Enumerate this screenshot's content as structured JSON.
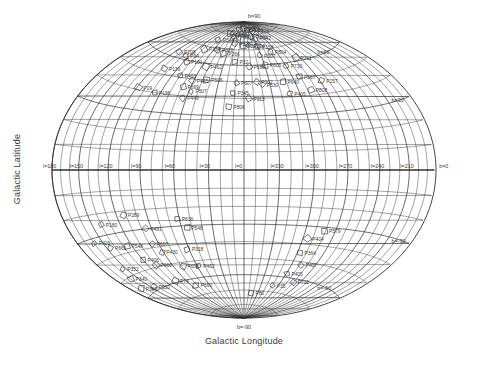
{
  "figure": {
    "type": "all-sky-aitoff-map",
    "xlabel": "Galactic Longitude",
    "ylabel": "Galactic Latitude",
    "background": "#ffffff",
    "line_color": "#2b2b2b",
    "text_color": "#3a3a3a"
  },
  "chart_data": {
    "type": "scatter",
    "title": "",
    "xlabel": "Galactic Longitude",
    "ylabel": "Galactic Latitude",
    "projection": "aitoff",
    "grid": true,
    "legend": false,
    "xlim": [
      360,
      0
    ],
    "ylim": [
      -90,
      90
    ],
    "x_tick_step_deg": 10,
    "y_tick_step_deg": 10,
    "x_label_step_deg": 30,
    "y_label_step_deg": 30,
    "xticklabels": [
      "l=180",
      "l=150",
      "l=120",
      "l=90",
      "l=60",
      "l=30",
      "l=0",
      "l=330",
      "l=300",
      "l=270",
      "l=240",
      "l=210"
    ],
    "xtickvalues": [
      180,
      150,
      120,
      90,
      60,
      30,
      0,
      330,
      300,
      270,
      240,
      210
    ],
    "yticklabels": [
      "b=90",
      "b=60",
      "b=30",
      "b=0",
      "b=-30",
      "b=-60",
      "b=-90"
    ],
    "ytickvalues": [
      90,
      60,
      30,
      0,
      -30,
      -60,
      -90
    ],
    "marker": "open-polygon",
    "point_count": 92,
    "points": [
      {
        "label": "P322",
        "l": 14,
        "b": 88
      },
      {
        "label": "P254",
        "l": 28,
        "b": 84
      },
      {
        "label": "P270",
        "l": 2,
        "b": 85
      },
      {
        "label": "P256",
        "l": 340,
        "b": 84
      },
      {
        "label": "P376",
        "l": 312,
        "b": 83
      },
      {
        "label": "P212",
        "l": 53,
        "b": 80
      },
      {
        "label": "P336",
        "l": 37,
        "b": 79
      },
      {
        "label": "P467",
        "l": 44,
        "b": 81
      },
      {
        "label": "P412",
        "l": 17,
        "b": 78
      },
      {
        "label": "P360",
        "l": 336,
        "b": 79
      },
      {
        "label": "P342",
        "l": 325,
        "b": 78
      },
      {
        "label": "P344",
        "l": 70,
        "b": 75
      },
      {
        "label": "P120",
        "l": 23,
        "b": 74
      },
      {
        "label": "P201",
        "l": 3,
        "b": 73
      },
      {
        "label": "P304",
        "l": 349,
        "b": 73
      },
      {
        "label": "P158",
        "l": 330,
        "b": 72
      },
      {
        "label": "P134",
        "l": 78,
        "b": 68
      },
      {
        "label": "P328",
        "l": 53,
        "b": 69
      },
      {
        "label": "P266",
        "l": 37,
        "b": 67
      },
      {
        "label": "P307",
        "l": 333,
        "b": 66
      },
      {
        "label": "P804",
        "l": 310,
        "b": 68
      },
      {
        "label": "P209",
        "l": 112,
        "b": 63
      },
      {
        "label": "P94",
        "l": 96,
        "b": 62
      },
      {
        "label": "P101",
        "l": 86,
        "b": 59
      },
      {
        "label": "P462",
        "l": 54,
        "b": 58
      },
      {
        "label": "P32",
        "l": 14,
        "b": 62
      },
      {
        "label": "P688",
        "l": 353,
        "b": 59
      },
      {
        "label": "P806",
        "l": 329,
        "b": 60
      },
      {
        "label": "P730",
        "l": 300,
        "b": 58
      },
      {
        "label": "P139",
        "l": 107,
        "b": 53
      },
      {
        "label": "P403",
        "l": 80,
        "b": 51
      },
      {
        "label": "P445",
        "l": 62,
        "b": 49
      },
      {
        "label": "P506",
        "l": 45,
        "b": 50
      },
      {
        "label": "P607",
        "l": 9,
        "b": 49
      },
      {
        "label": "P902",
        "l": 345,
        "b": 50
      },
      {
        "label": "P567",
        "l": 291,
        "b": 51
      },
      {
        "label": "P530",
        "l": 339,
        "b": 48
      },
      {
        "label": "P640",
        "l": 314,
        "b": 49
      },
      {
        "label": "P211",
        "l": 276,
        "b": 62
      },
      {
        "label": "P257",
        "l": 268,
        "b": 47
      },
      {
        "label": "P669",
        "l": 69,
        "b": 45
      },
      {
        "label": "P507",
        "l": 58,
        "b": 43
      },
      {
        "label": "P345",
        "l": 12,
        "b": 43
      },
      {
        "label": "P913",
        "l": 355,
        "b": 40
      },
      {
        "label": "P405",
        "l": 311,
        "b": 42
      },
      {
        "label": "P808",
        "l": 286,
        "b": 43
      },
      {
        "label": "P19",
        "l": 118,
        "b": 41
      },
      {
        "label": "P136",
        "l": 97,
        "b": 40
      },
      {
        "label": "P449",
        "l": 64,
        "b": 39
      },
      {
        "label": "P806b",
        "l": 15,
        "b": 35
      },
      {
        "label": "P180",
        "l": 140,
        "b": -25
      },
      {
        "label": "P289",
        "l": 113,
        "b": -22
      },
      {
        "label": "P636",
        "l": 62,
        "b": -26
      },
      {
        "label": "P491",
        "l": 96,
        "b": -30
      },
      {
        "label": "P548",
        "l": 55,
        "b": -31
      },
      {
        "label": "P415",
        "l": 160,
        "b": -32
      },
      {
        "label": "P661",
        "l": 146,
        "b": -36
      },
      {
        "label": "P548b",
        "l": 126,
        "b": -37
      },
      {
        "label": "P607b",
        "l": 97,
        "b": -38
      },
      {
        "label": "P579",
        "l": 281,
        "b": -32
      },
      {
        "label": "P404",
        "l": 295,
        "b": -37
      },
      {
        "label": "P430",
        "l": 92,
        "b": -43
      },
      {
        "label": "P318",
        "l": 62,
        "b": -43
      },
      {
        "label": "P352",
        "l": 155,
        "b": -46
      },
      {
        "label": "P406",
        "l": 120,
        "b": -45
      },
      {
        "label": "P660",
        "l": 110,
        "b": -49
      },
      {
        "label": "P364",
        "l": 297,
        "b": -45
      },
      {
        "label": "P340",
        "l": 160,
        "b": -51
      },
      {
        "label": "P656",
        "l": 78,
        "b": -52
      },
      {
        "label": "P462b",
        "l": 58,
        "b": -53
      },
      {
        "label": "P407",
        "l": 288,
        "b": -52
      },
      {
        "label": "P369",
        "l": 165,
        "b": -56
      },
      {
        "label": "P550",
        "l": 145,
        "b": -58
      },
      {
        "label": "P74",
        "l": 105,
        "b": -59
      },
      {
        "label": "P405b",
        "l": 299,
        "b": -58
      },
      {
        "label": "P711",
        "l": 281,
        "b": -62
      },
      {
        "label": "P660b",
        "l": 82,
        "b": -64
      },
      {
        "label": "P35",
        "l": 310,
        "b": -66
      },
      {
        "label": "P80",
        "l": 345,
        "b": -72
      }
    ]
  }
}
